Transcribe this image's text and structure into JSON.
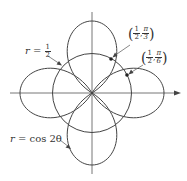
{
  "diagram": {
    "type": "polar-graph",
    "curves": [
      {
        "name": "rose",
        "equation": "r = cos 2θ",
        "label_lhs": "r",
        "label_eq": "=",
        "label_rhs": "cos 2θ"
      },
      {
        "name": "circle",
        "equation": "r = 1/2",
        "label_lhs": "r",
        "label_eq": "=",
        "label_num": "1",
        "label_den": "2"
      }
    ],
    "points": [
      {
        "label": "(1/2, π/3)",
        "r_num": "1",
        "r_den": "2",
        "theta_num": "π",
        "theta_den": "3"
      },
      {
        "label": "(1/2, π/6)",
        "r_num": "1",
        "r_den": "2",
        "theta_num": "π",
        "theta_den": "6"
      }
    ],
    "separator": ",",
    "colors": {
      "curve": "#444444",
      "axis": "#666666",
      "text": "#333333",
      "dot": "#222222"
    }
  }
}
